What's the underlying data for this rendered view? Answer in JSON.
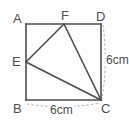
{
  "figure": {
    "shape": "square",
    "stroke_color": "#4d4d4d",
    "dashed_color": "#a8a8a8",
    "background_color": "#fdfdfd",
    "vertices": [
      {
        "id": "A",
        "label": "A",
        "role": "square-corner",
        "position": "top-left",
        "x": 26,
        "y": 24
      },
      {
        "id": "D",
        "label": "D",
        "role": "square-corner",
        "position": "top-right",
        "x": 101,
        "y": 24
      },
      {
        "id": "B",
        "label": "B",
        "role": "square-corner",
        "position": "bottom-left",
        "x": 26,
        "y": 100
      },
      {
        "id": "C",
        "label": "C",
        "role": "square-corner",
        "position": "bottom-right",
        "x": 101,
        "y": 100
      },
      {
        "id": "F",
        "label": "F",
        "role": "point-on-edge",
        "position": "top-edge",
        "x": 64,
        "y": 24
      },
      {
        "id": "E",
        "label": "E",
        "role": "point-on-edge",
        "position": "left-edge",
        "x": 26,
        "y": 62
      }
    ],
    "solid_segments": [
      {
        "name": "side-AD",
        "from": "A",
        "to": "D"
      },
      {
        "name": "side-DC",
        "from": "D",
        "to": "C"
      },
      {
        "name": "side-CB",
        "from": "C",
        "to": "B"
      },
      {
        "name": "side-BA",
        "from": "B",
        "to": "A"
      },
      {
        "name": "segment-EF",
        "from": "E",
        "to": "F"
      },
      {
        "name": "segment-FC",
        "from": "F",
        "to": "C"
      },
      {
        "name": "segment-EC",
        "from": "E",
        "to": "C"
      }
    ],
    "measurements": [
      {
        "name": "right-side-length",
        "value": "6cm",
        "applies_to": "DC",
        "orientation": "vertical"
      },
      {
        "name": "bottom-side-length",
        "value": "6cm",
        "applies_to": "BC",
        "orientation": "horizontal"
      }
    ]
  }
}
